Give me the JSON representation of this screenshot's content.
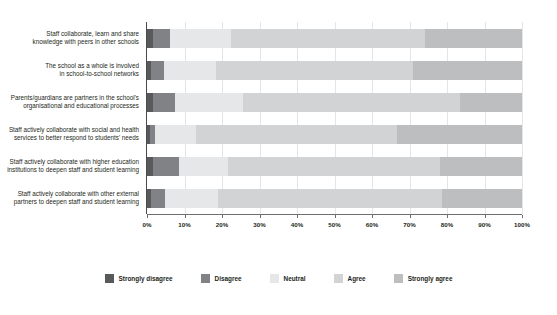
{
  "chart_data": {
    "type": "bar",
    "orientation": "horizontal",
    "stacked": true,
    "stack_mode": "percent",
    "title": "",
    "xlabel": "",
    "ylabel": "",
    "xlim": [
      0,
      100
    ],
    "grid": true,
    "legend_position": "bottom",
    "x_ticks": [
      "0%",
      "10%",
      "20%",
      "30%",
      "40%",
      "50%",
      "60%",
      "70%",
      "80%",
      "90%",
      "100%"
    ],
    "x_tick_values": [
      0,
      10,
      20,
      30,
      40,
      50,
      60,
      70,
      80,
      90,
      100
    ],
    "categories": [
      "Staff collaborate, learn and share knowledge with peers in other schools",
      "The school as a whole is involved in school-to-school networks",
      "Parents/guardians are partners in the school's organisational and educational processes",
      "Staff actively collaborate with social and health services to better respond to students' needs",
      "Staff actively collaborate with higher education institutions to deepen staff and student learning",
      "Staff actively collaborate with other external partners to deepen staff and student learning"
    ],
    "category_lines": [
      [
        "Staff collaborate, learn and share",
        "knowledge with peers in other schools"
      ],
      [
        "The school as a whole is involved",
        "in school-to-school networks"
      ],
      [
        "Parents/guardians are partners in the school's",
        "organisational and educational processes"
      ],
      [
        "Staff actively collaborate with social and health",
        "services to better respond to students' needs"
      ],
      [
        "Staff actively collaborate with higher education",
        "institutions to deepen staff and student learning"
      ],
      [
        "Staff actively collaborate with other external",
        "partners to deepen staff and student learning"
      ]
    ],
    "series": [
      {
        "name": "Strongly disagree",
        "color": "#58595b",
        "values": [
          1.5,
          1.0,
          1.5,
          0.8,
          1.5,
          1.0
        ]
      },
      {
        "name": "Disagree",
        "color": "#808285",
        "values": [
          4.5,
          3.5,
          6.0,
          1.4,
          6.9,
          3.8
        ]
      },
      {
        "name": "Neutral",
        "color": "#e6e7e8",
        "values": [
          16.5,
          14.0,
          18.0,
          10.8,
          13.1,
          14.2
        ]
      },
      {
        "name": "Agree",
        "color": "#d1d3d4",
        "values": [
          51.5,
          52.5,
          58.0,
          53.7,
          56.5,
          59.7
        ]
      },
      {
        "name": "Strongly agree",
        "color": "#bcbec0",
        "values": [
          26.0,
          29.0,
          16.5,
          33.3,
          22.0,
          21.3
        ]
      }
    ]
  },
  "legend": {
    "items": [
      {
        "label": "Strongly disagree",
        "color": "#58595b"
      },
      {
        "label": "Disagree",
        "color": "#808285"
      },
      {
        "label": "Neutral",
        "color": "#e6e7e8"
      },
      {
        "label": "Agree",
        "color": "#d1d3d4"
      },
      {
        "label": "Strongly agree",
        "color": "#bcbec0"
      }
    ]
  }
}
